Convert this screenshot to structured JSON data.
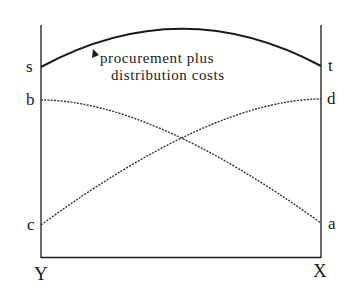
{
  "diagram": {
    "type": "cost-curve-diagram",
    "axes": {
      "left_label": "Y",
      "right_label": "X"
    },
    "point_labels": {
      "s": "s",
      "b": "b",
      "c": "c",
      "t": "t",
      "d": "d",
      "a": "a"
    },
    "annotation": {
      "line1": "procurement plus",
      "line2": "distribution costs"
    },
    "curves": [
      {
        "name": "total-cost-curve",
        "from": "s",
        "to": "t",
        "style": "solid"
      },
      {
        "name": "cost-curve-b-a",
        "from": "b",
        "to": "a",
        "style": "dotted"
      },
      {
        "name": "cost-curve-c-d",
        "from": "c",
        "to": "d",
        "style": "dotted"
      }
    ],
    "colors": {
      "ink": "#1a1a1a",
      "background": "#ffffff"
    }
  }
}
